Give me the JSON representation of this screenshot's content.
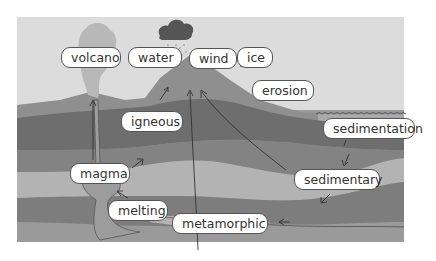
{
  "diagram": {
    "colors": {
      "sky": "#dcdcdc",
      "mountain": "#8f8f8f",
      "layer_dark": "#6e6e6e",
      "layer_mid": "#858585",
      "layer_light": "#b3b3b3",
      "deep": "#9a9a9a",
      "label_bg": "#ffffff",
      "label_border": "#555555"
    },
    "labels": {
      "volcano": "volcano",
      "water": "water",
      "wind": "wind",
      "ice": "ice",
      "erosion": "erosion",
      "igneous": "igneous",
      "sedimentation": "sedimentation",
      "magma": "magma",
      "sedimentary": "sedimentary",
      "melting": "melting",
      "metamorphic": "metamorphic"
    }
  }
}
